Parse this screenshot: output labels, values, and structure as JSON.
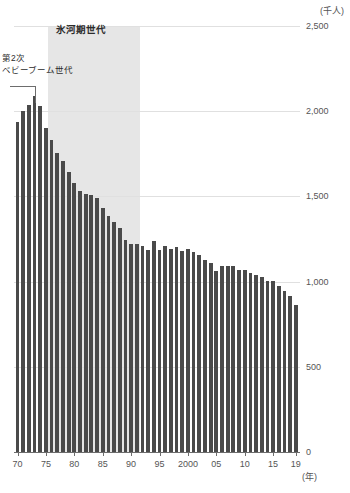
{
  "chart_data": {
    "type": "bar",
    "title": "",
    "subtitle": "",
    "xlabel": "(年)",
    "ylabel": "(千人)",
    "unit_label": "(千人)",
    "xaxis_unit": "(年)",
    "ylim": [
      0,
      2500
    ],
    "ytick_values": [
      0,
      500,
      1000,
      1500,
      2000,
      2500
    ],
    "ytick_labels": [
      "0",
      "500",
      "1,000",
      "1,500",
      "2,000",
      "2,500"
    ],
    "grid": true,
    "legend": "none",
    "bar_color": "#4a4a4a",
    "shade_color": "#e2e2e2",
    "axis_color": "#6d6d6d",
    "xtick_years": [
      1970,
      1975,
      1980,
      1985,
      1990,
      1995,
      2000,
      2005,
      2010,
      2015,
      2019
    ],
    "xtick_labels": [
      "70",
      "75",
      "80",
      "85",
      "90",
      "95",
      "2000",
      "05",
      "10",
      "15",
      "19"
    ],
    "x": [
      1970,
      1971,
      1972,
      1973,
      1974,
      1975,
      1976,
      1977,
      1978,
      1979,
      1980,
      1981,
      1982,
      1983,
      1984,
      1985,
      1986,
      1987,
      1988,
      1989,
      1990,
      1991,
      1992,
      1993,
      1994,
      1995,
      1996,
      1997,
      1998,
      1999,
      2000,
      2001,
      2002,
      2003,
      2004,
      2005,
      2006,
      2007,
      2008,
      2009,
      2010,
      2011,
      2012,
      2013,
      2014,
      2015,
      2016,
      2017,
      2018,
      2019
    ],
    "categories": [
      "1970",
      "1971",
      "1972",
      "1973",
      "1974",
      "1975",
      "1976",
      "1977",
      "1978",
      "1979",
      "1980",
      "1981",
      "1982",
      "1983",
      "1984",
      "1985",
      "1986",
      "1987",
      "1988",
      "1989",
      "1990",
      "1991",
      "1992",
      "1993",
      "1994",
      "1995",
      "1996",
      "1997",
      "1998",
      "1999",
      "2000",
      "2001",
      "2002",
      "2003",
      "2004",
      "2005",
      "2006",
      "2007",
      "2008",
      "2009",
      "2010",
      "2011",
      "2012",
      "2013",
      "2014",
      "2015",
      "2016",
      "2017",
      "2018",
      "2019"
    ],
    "values": [
      1934,
      2001,
      2039,
      2092,
      2030,
      1901,
      1833,
      1755,
      1709,
      1643,
      1577,
      1529,
      1515,
      1509,
      1490,
      1432,
      1383,
      1347,
      1314,
      1247,
      1222,
      1223,
      1209,
      1188,
      1238,
      1187,
      1207,
      1192,
      1203,
      1178,
      1191,
      1171,
      1154,
      1124,
      1111,
      1063,
      1093,
      1090,
      1091,
      1070,
      1071,
      1051,
      1037,
      1030,
      1004,
      1006,
      977,
      946,
      918,
      865
    ],
    "annotations": [
      {
        "id": "ice-age-generation",
        "text": "氷河期世代",
        "kind": "band-label",
        "band_start_year": 1976,
        "band_end_year": 1991
      },
      {
        "id": "second-baby-boom-generation",
        "line1": "第2次",
        "line2": "ベビーブーム世代",
        "kind": "leader-label",
        "points_to_year": 1973
      }
    ]
  }
}
